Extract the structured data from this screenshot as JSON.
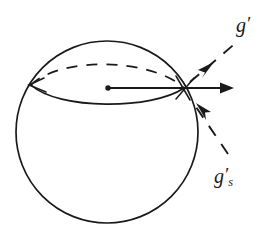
{
  "figure": {
    "type": "line-diagram",
    "background_color": "#ffffff",
    "stroke_color": "#1a1a1a",
    "canvas": {
      "width": 278,
      "height": 240
    }
  },
  "labels": {
    "g_prime": {
      "base": "g",
      "prime": "′",
      "subscript": "",
      "text": "g′",
      "x": 247,
      "y": 27
    },
    "gs_prime": {
      "base": "g",
      "prime": "′",
      "subscript": "s",
      "text": "g′s",
      "x": 226,
      "y": 178
    }
  },
  "shapes": {
    "sphere_outline": {
      "name": "sphere-circle",
      "cx": 107,
      "cy": 132,
      "r": 91,
      "style": "solid"
    },
    "equator_back": {
      "name": "equator-back-arc",
      "style": "dashed",
      "from_x": 31,
      "from_y": 85,
      "to_x": 184,
      "to_y": 88,
      "peak_y": 61
    },
    "equator_front": {
      "name": "equator-front-arc",
      "style": "solid",
      "from_x": 31,
      "from_y": 85,
      "to_x": 184,
      "to_y": 88,
      "dip_y": 106
    },
    "center_dot": {
      "name": "sphere-center-point",
      "cx": 108,
      "cy": 88,
      "r": 2.6
    }
  },
  "vectors": [
    {
      "name": "horizontal-vector",
      "style": "solid",
      "from_x": 108,
      "from_y": 88,
      "to_x": 233,
      "to_y": 88,
      "arrowhead": "end",
      "label": ""
    },
    {
      "name": "g-prime-vector",
      "style": "dashed",
      "from_x": 184,
      "from_y": 88,
      "to_x": 238,
      "to_y": 42,
      "arrowhead": "mid-outward",
      "arrow_x": 211,
      "arrow_y": 66,
      "label": "g′"
    },
    {
      "name": "gs-prime-vector",
      "style": "dashed",
      "from_x": 226,
      "from_y": 156,
      "to_x": 190,
      "to_y": 100,
      "arrowhead": "mid-inward",
      "arrow_x": 200,
      "arrow_y": 112,
      "label": "g′s"
    }
  ],
  "tick_marks": {
    "left_junction": {
      "name": "left-junction-tick",
      "x": 31,
      "y": 85
    },
    "right_junction": {
      "name": "right-junction-tick",
      "x": 184,
      "y": 88
    }
  }
}
